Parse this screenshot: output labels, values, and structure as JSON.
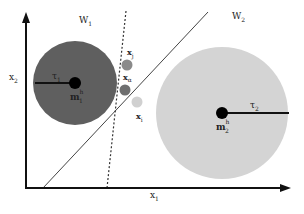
{
  "diagram": {
    "type": "feature-space classification diagram",
    "axes": {
      "x_label": "x",
      "x_sub": "1",
      "y_label": "x",
      "y_sub": "2"
    },
    "regions": [
      {
        "label": "W",
        "sub": "1"
      },
      {
        "label": "W",
        "sub": "2"
      }
    ],
    "classes": [
      {
        "name": "class-1",
        "fill": "#5f5f5f",
        "center_label": "m",
        "center_sup": "h",
        "center_sub": "1",
        "radius_label": "τ",
        "radius_sub": "1"
      },
      {
        "name": "class-2",
        "fill": "#d4d4d4",
        "center_label": "m",
        "center_sup": "h",
        "center_sub": "2",
        "radius_label": "τ",
        "radius_sub": "2"
      }
    ],
    "samples": [
      {
        "label": "x",
        "sub": "j",
        "fill": "#8a8a8a"
      },
      {
        "label": "x",
        "sub": "α",
        "fill": "#6f6f6f"
      },
      {
        "label": "x",
        "sub": "i",
        "fill": "#d0d0d0"
      }
    ],
    "boundaries": [
      {
        "name": "solid-boundary",
        "style": "solid"
      },
      {
        "name": "dashed-boundary",
        "style": "dashed"
      }
    ]
  }
}
